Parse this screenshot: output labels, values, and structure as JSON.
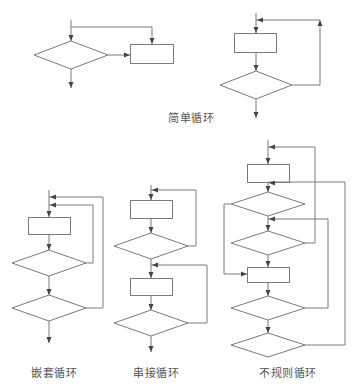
{
  "colors": {
    "stroke": "#7a7a7a",
    "text": "#555555",
    "background": "#ffffff"
  },
  "labels": [
    {
      "id": "simple",
      "text": "简单循环",
      "x": 191,
      "y": 117
    },
    {
      "id": "nested",
      "text": "嵌套循环",
      "x": 54,
      "y": 372
    },
    {
      "id": "series",
      "text": "串接循环",
      "x": 156,
      "y": 372
    },
    {
      "id": "irregular",
      "text": "不规则循环",
      "x": 288,
      "y": 372
    }
  ],
  "diagrams": [
    {
      "name": "simple-loop-while",
      "rects": [
        {
          "x": 130,
          "y": 44,
          "w": 43,
          "h": 19
        }
      ],
      "diamonds": [
        {
          "cx": 71,
          "cy": 55,
          "hw": 37,
          "hh": 14
        }
      ],
      "lines": [
        [
          [
            71,
            20
          ],
          [
            71,
            41
          ]
        ],
        [
          [
            71,
            27
          ],
          [
            152,
            27
          ],
          [
            152,
            44
          ]
        ],
        [
          [
            108,
            55
          ],
          [
            130,
            55
          ]
        ],
        [
          [
            71,
            69
          ],
          [
            71,
            88
          ]
        ]
      ],
      "arrows": [
        {
          "x": 71,
          "y": 41,
          "dir": "down"
        },
        {
          "x": 152,
          "y": 44,
          "dir": "down"
        },
        {
          "x": 130,
          "y": 55,
          "dir": "right"
        },
        {
          "x": 71,
          "y": 88,
          "dir": "down"
        }
      ]
    },
    {
      "name": "simple-loop-until",
      "rects": [
        {
          "x": 234,
          "y": 33,
          "w": 42,
          "h": 19
        }
      ],
      "diamonds": [
        {
          "cx": 256,
          "cy": 85,
          "hw": 36,
          "hh": 14
        }
      ],
      "lines": [
        [
          [
            256,
            13
          ],
          [
            256,
            33
          ]
        ],
        [
          [
            256,
            52
          ],
          [
            256,
            71
          ]
        ],
        [
          [
            292,
            85
          ],
          [
            320,
            85
          ],
          [
            320,
            20
          ],
          [
            256,
            20
          ]
        ],
        [
          [
            256,
            99
          ],
          [
            256,
            118
          ]
        ]
      ],
      "arrows": [
        {
          "x": 256,
          "y": 33,
          "dir": "down"
        },
        {
          "x": 256,
          "y": 71,
          "dir": "down"
        },
        {
          "x": 320,
          "y": 20,
          "dir": "up"
        },
        {
          "x": 257,
          "y": 20,
          "dir": "left"
        },
        {
          "x": 256,
          "y": 118,
          "dir": "down"
        }
      ]
    },
    {
      "name": "nested-loop",
      "rects": [
        {
          "x": 28,
          "y": 217,
          "w": 42,
          "h": 17
        }
      ],
      "diamonds": [
        {
          "cx": 49,
          "cy": 263,
          "hw": 37,
          "hh": 13
        },
        {
          "cx": 49,
          "cy": 308,
          "hw": 37,
          "hh": 13
        }
      ],
      "lines": [
        [
          [
            49,
            190
          ],
          [
            49,
            217
          ]
        ],
        [
          [
            49,
            234
          ],
          [
            49,
            250
          ]
        ],
        [
          [
            49,
            276
          ],
          [
            49,
            295
          ]
        ],
        [
          [
            49,
            321
          ],
          [
            49,
            343
          ]
        ],
        [
          [
            86,
            263
          ],
          [
            93,
            263
          ],
          [
            93,
            205
          ],
          [
            49,
            205
          ]
        ],
        [
          [
            86,
            308
          ],
          [
            103,
            308
          ],
          [
            103,
            197
          ],
          [
            49,
            197
          ]
        ]
      ],
      "arrows": [
        {
          "x": 50,
          "y": 197,
          "dir": "left"
        },
        {
          "x": 50,
          "y": 205,
          "dir": "left"
        },
        {
          "x": 49,
          "y": 217,
          "dir": "down"
        },
        {
          "x": 49,
          "y": 250,
          "dir": "down"
        },
        {
          "x": 49,
          "y": 295,
          "dir": "down"
        },
        {
          "x": 49,
          "y": 343,
          "dir": "down"
        }
      ]
    },
    {
      "name": "series-loop",
      "rects": [
        {
          "x": 130,
          "y": 200,
          "w": 42,
          "h": 18
        },
        {
          "x": 130,
          "y": 278,
          "w": 42,
          "h": 17
        }
      ],
      "diamonds": [
        {
          "cx": 151,
          "cy": 246,
          "hw": 37,
          "hh": 13
        },
        {
          "cx": 151,
          "cy": 323,
          "hw": 37,
          "hh": 13
        }
      ],
      "lines": [
        [
          [
            151,
            185
          ],
          [
            151,
            200
          ]
        ],
        [
          [
            151,
            218
          ],
          [
            151,
            233
          ]
        ],
        [
          [
            151,
            259
          ],
          [
            151,
            278
          ]
        ],
        [
          [
            151,
            295
          ],
          [
            151,
            310
          ]
        ],
        [
          [
            151,
            336
          ],
          [
            151,
            352
          ]
        ],
        [
          [
            188,
            246
          ],
          [
            196,
            246
          ],
          [
            196,
            190
          ],
          [
            151,
            190
          ]
        ],
        [
          [
            188,
            323
          ],
          [
            207,
            323
          ],
          [
            207,
            265
          ],
          [
            151,
            265
          ]
        ]
      ],
      "arrows": [
        {
          "x": 152,
          "y": 190,
          "dir": "left"
        },
        {
          "x": 151,
          "y": 200,
          "dir": "down"
        },
        {
          "x": 151,
          "y": 233,
          "dir": "down"
        },
        {
          "x": 152,
          "y": 265,
          "dir": "left"
        },
        {
          "x": 151,
          "y": 278,
          "dir": "down"
        },
        {
          "x": 151,
          "y": 310,
          "dir": "down"
        },
        {
          "x": 151,
          "y": 352,
          "dir": "down"
        }
      ]
    },
    {
      "name": "irregular-loop",
      "rects": [
        {
          "x": 247,
          "y": 164,
          "w": 42,
          "h": 18
        },
        {
          "x": 247,
          "y": 267,
          "w": 42,
          "h": 15
        }
      ],
      "diamonds": [
        {
          "cx": 268,
          "cy": 204,
          "hw": 37,
          "hh": 12
        },
        {
          "cx": 268,
          "cy": 243,
          "hw": 37,
          "hh": 12
        },
        {
          "cx": 268,
          "cy": 308,
          "hw": 37,
          "hh": 12
        },
        {
          "cx": 268,
          "cy": 345,
          "hw": 37,
          "hh": 12
        }
      ],
      "lines": [
        [
          [
            268,
            140
          ],
          [
            268,
            164
          ]
        ],
        [
          [
            268,
            182
          ],
          [
            268,
            192
          ]
        ],
        [
          [
            268,
            216
          ],
          [
            268,
            231
          ]
        ],
        [
          [
            268,
            255
          ],
          [
            268,
            267
          ]
        ],
        [
          [
            268,
            282
          ],
          [
            268,
            296
          ]
        ],
        [
          [
            268,
            320
          ],
          [
            268,
            333
          ]
        ],
        [
          [
            231,
            204
          ],
          [
            224,
            204
          ],
          [
            224,
            274
          ],
          [
            247,
            274
          ]
        ],
        [
          [
            305,
            243
          ],
          [
            315,
            243
          ],
          [
            315,
            147
          ],
          [
            268,
            147
          ]
        ],
        [
          [
            305,
            308
          ],
          [
            328,
            308
          ],
          [
            328,
            219
          ],
          [
            268,
            219
          ]
        ],
        [
          [
            305,
            345
          ],
          [
            345,
            345
          ],
          [
            345,
            182
          ],
          [
            268,
            182
          ]
        ]
      ],
      "arrows": [
        {
          "x": 269,
          "y": 147,
          "dir": "left"
        },
        {
          "x": 268,
          "y": 164,
          "dir": "down"
        },
        {
          "x": 269,
          "y": 183,
          "dir": "left"
        },
        {
          "x": 268,
          "y": 192,
          "dir": "down"
        },
        {
          "x": 269,
          "y": 219,
          "dir": "left"
        },
        {
          "x": 268,
          "y": 231,
          "dir": "down"
        },
        {
          "x": 268,
          "y": 267,
          "dir": "down"
        },
        {
          "x": 247,
          "y": 274,
          "dir": "right"
        },
        {
          "x": 268,
          "y": 296,
          "dir": "down"
        },
        {
          "x": 268,
          "y": 333,
          "dir": "down"
        }
      ]
    }
  ]
}
